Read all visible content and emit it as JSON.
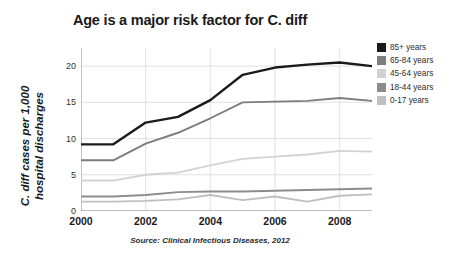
{
  "chart_data": {
    "type": "line",
    "title": "Age is a major risk factor for C. diff",
    "xlabel": "",
    "ylabel": "C. diff cases per 1,000\nhospital discharges",
    "source": "Source: Clinical Infectious Diseases, 2012",
    "x": [
      2000,
      2001,
      2002,
      2003,
      2004,
      2005,
      2006,
      2007,
      2008,
      2009
    ],
    "xtick_labels": [
      "2000",
      "2002",
      "2004",
      "2006",
      "2008"
    ],
    "xtick_values": [
      2000,
      2002,
      2004,
      2006,
      2008
    ],
    "xlim": [
      2000,
      2009
    ],
    "ytick_labels": [
      "0",
      "5",
      "10",
      "15",
      "20"
    ],
    "ytick_values": [
      0,
      5,
      10,
      15,
      20
    ],
    "ylim": [
      0,
      22.5
    ],
    "grid": true,
    "legend_position": "right",
    "series": [
      {
        "name": "85+ years",
        "color": "#1a1a1a",
        "values": [
          9.2,
          9.2,
          12.2,
          13.0,
          15.3,
          18.8,
          19.8,
          20.2,
          20.5,
          20.0
        ]
      },
      {
        "name": "65-84 years",
        "color": "#7d7d7d",
        "values": [
          7.0,
          7.0,
          9.3,
          10.8,
          12.8,
          15.0,
          15.1,
          15.2,
          15.6,
          15.2
        ]
      },
      {
        "name": "45-64 years",
        "color": "#d2d2d2",
        "values": [
          4.2,
          4.2,
          5.0,
          5.3,
          6.3,
          7.2,
          7.5,
          7.8,
          8.3,
          8.2
        ]
      },
      {
        "name": "18-44 years",
        "color": "#8c8c8c",
        "values": [
          2.0,
          2.0,
          2.2,
          2.6,
          2.7,
          2.7,
          2.8,
          2.9,
          3.0,
          3.1
        ]
      },
      {
        "name": "0-17 years",
        "color": "#bfbfbf",
        "values": [
          1.3,
          1.3,
          1.4,
          1.6,
          2.2,
          1.5,
          2.0,
          1.3,
          2.1,
          2.3
        ]
      }
    ]
  },
  "legend": {
    "items": [
      {
        "label": "85+ years",
        "color": "#1a1a1a"
      },
      {
        "label": "65-84 years",
        "color": "#7d7d7d"
      },
      {
        "label": "45-64 years",
        "color": "#d2d2d2"
      },
      {
        "label": "18-44 years",
        "color": "#8c8c8c"
      },
      {
        "label": "0-17 years",
        "color": "#bfbfbf"
      }
    ]
  }
}
